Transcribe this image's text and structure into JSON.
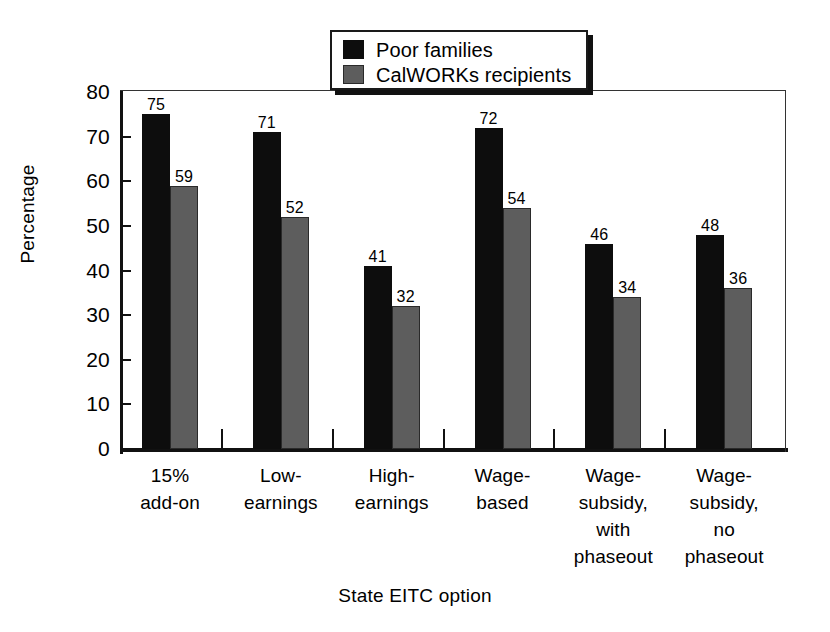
{
  "chart_data": {
    "type": "bar",
    "title": "",
    "xlabel": "State EITC option",
    "ylabel": "Percentage",
    "ylim": [
      0,
      80
    ],
    "ytick_values": [
      0,
      10,
      20,
      30,
      40,
      50,
      60,
      70,
      80
    ],
    "ytick_labels": [
      "0",
      "10",
      "20",
      "30",
      "40",
      "50",
      "60",
      "70",
      "80"
    ],
    "grid": false,
    "legend_position": "top-center",
    "categories": [
      "15%\nadd-on",
      "Low-\nearnings",
      "High-\nearnings",
      "Wage-\nbased",
      "Wage-\nsubsidy,\nwith\nphaseout",
      "Wage-\nsubsidy,\nno\nphaseout"
    ],
    "category_lines": [
      [
        "15%",
        "add-on"
      ],
      [
        "Low-",
        "earnings"
      ],
      [
        "High-",
        "earnings"
      ],
      [
        "Wage-",
        "based"
      ],
      [
        "Wage-",
        "subsidy,",
        "with",
        "phaseout"
      ],
      [
        "Wage-",
        "subsidy,",
        "no",
        "phaseout"
      ]
    ],
    "series": [
      {
        "name": "Poor families",
        "color": "#0d0d0d",
        "values": [
          75,
          71,
          41,
          72,
          46,
          48
        ],
        "value_labels": [
          "75",
          "71",
          "41",
          "72",
          "46",
          "48"
        ]
      },
      {
        "name": "CalWORKs recipients",
        "color": "#5d5d5d",
        "values": [
          59,
          52,
          32,
          54,
          34,
          36
        ],
        "value_labels": [
          "59",
          "52",
          "32",
          "54",
          "34",
          "36"
        ]
      }
    ]
  },
  "legend": {
    "entries": [
      {
        "label": "Poor families",
        "swatch": "black-square-icon"
      },
      {
        "label": "CalWORKs recipients",
        "swatch": "gray-square-icon"
      }
    ]
  },
  "axes": {
    "y_title": "Percentage",
    "x_title": "State EITC option"
  }
}
